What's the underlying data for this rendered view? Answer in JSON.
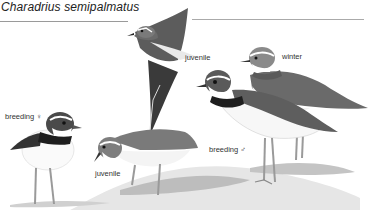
{
  "plate": {
    "species_name": "Charadrius semipalmatus",
    "labels": {
      "flying": "juvenile",
      "winter": "winter",
      "breeding_female": "breeding ♀",
      "juvenile_standing": "juvenile",
      "breeding_male": "breeding ♂"
    },
    "colors": {
      "dark": "#2a2a2a",
      "mantle": "#6e6e6e",
      "white": "#ffffff",
      "shadow": "#c9c9c9",
      "legs": "#9a9a9a"
    }
  }
}
